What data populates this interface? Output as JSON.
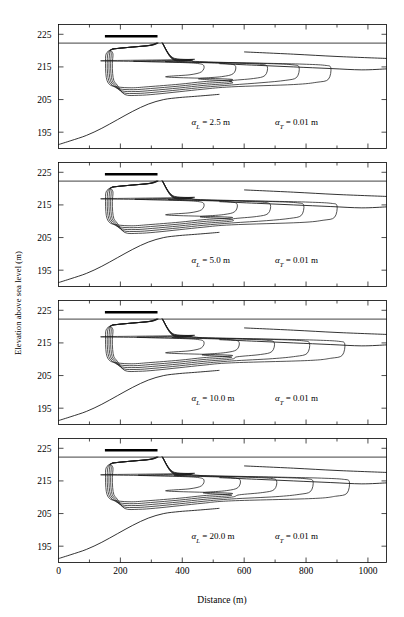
{
  "figure": {
    "axis": {
      "x_label": "Distance (m)",
      "y_label": "Elevation above sea level (m)",
      "x_ticks": [
        "0",
        "200",
        "400",
        "600",
        "800",
        "1000"
      ],
      "x_tick_values": [
        0,
        200,
        400,
        600,
        800,
        1000
      ],
      "x_minor_values": [
        100,
        300,
        500,
        700,
        900
      ],
      "y_ticks": [
        "225",
        "215",
        "205",
        "195"
      ],
      "y_tick_values": [
        225,
        215,
        205,
        195
      ],
      "x_range": [
        0,
        1060
      ],
      "y_range": [
        190,
        228
      ]
    },
    "panels": [
      {
        "id": "panel-1",
        "alpha_l_symbol": "α",
        "alpha_l_sub": "L",
        "alpha_l_text": " = 2.5 m",
        "alpha_t_symbol": "α",
        "alpha_t_sub": "T",
        "alpha_t_text": " = 0.01 m",
        "alpha_l_value": 2.5,
        "alpha_t_value": 0.01,
        "units": "m",
        "plume_extent_m": 880,
        "source_start_m": 150,
        "source_end_m": 320,
        "water_table_elev": 222.3,
        "n_contours": 5
      },
      {
        "id": "panel-2",
        "alpha_l_symbol": "α",
        "alpha_l_sub": "L",
        "alpha_l_text": " = 5.0 m",
        "alpha_t_symbol": "α",
        "alpha_t_sub": "T",
        "alpha_t_text": " = 0.01 m",
        "alpha_l_value": 5.0,
        "alpha_t_value": 0.01,
        "units": "m",
        "plume_extent_m": 900,
        "source_start_m": 150,
        "source_end_m": 320,
        "water_table_elev": 222.3,
        "n_contours": 5
      },
      {
        "id": "panel-3",
        "alpha_l_symbol": "α",
        "alpha_l_sub": "L",
        "alpha_l_text": " = 10.0 m",
        "alpha_t_symbol": "α",
        "alpha_t_sub": "T",
        "alpha_t_text": " = 0.01 m",
        "alpha_l_value": 10.0,
        "alpha_t_value": 0.01,
        "units": "m",
        "plume_extent_m": 925,
        "source_start_m": 150,
        "source_end_m": 320,
        "water_table_elev": 222.3,
        "n_contours": 5
      },
      {
        "id": "panel-4",
        "alpha_l_symbol": "α",
        "alpha_l_sub": "L",
        "alpha_l_text": " = 20.0 m",
        "alpha_t_symbol": "α",
        "alpha_t_sub": "T",
        "alpha_t_text": " = 0.01 m",
        "alpha_l_value": 20.0,
        "alpha_t_value": 0.01,
        "units": "m",
        "plume_extent_m": 940,
        "source_start_m": 150,
        "source_end_m": 320,
        "water_table_elev": 222.3,
        "n_contours": 5
      }
    ]
  },
  "chart_data": {
    "type": "line",
    "title": "",
    "xlabel": "Distance (m)",
    "ylabel": "Elevation above sea level (m)",
    "xlim": [
      0,
      1060
    ],
    "ylim": [
      190,
      228
    ],
    "grid": false,
    "legend": null,
    "subplot_layout": "4 rows x 1 column, shared x-axis",
    "categories": [
      "2.5",
      "5.0",
      "10.0",
      "20.0"
    ],
    "series": [
      {
        "name": "alpha_L (m)",
        "values": [
          2.5,
          5.0,
          10.0,
          20.0
        ]
      },
      {
        "name": "alpha_T (m)",
        "values": [
          0.01,
          0.01,
          0.01,
          0.01
        ]
      },
      {
        "name": "plume downgradient extent (m)",
        "values": [
          880,
          900,
          925,
          940
        ]
      }
    ],
    "annotations": [
      "α_L = 2.5 m    α_T = 0.01 m",
      "α_L = 5.0 m    α_T = 0.01 m",
      "α_L = 10.0 m    α_T = 0.01 m",
      "α_L = 20.0 m    α_T = 0.01 m"
    ],
    "x_ticks": [
      0,
      200,
      400,
      600,
      800,
      1000
    ],
    "y_ticks": [
      195,
      205,
      215,
      225
    ]
  }
}
